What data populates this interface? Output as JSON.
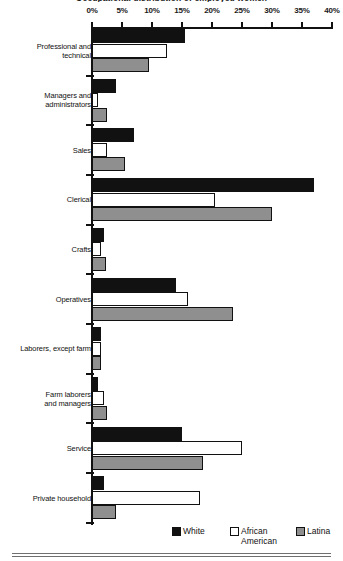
{
  "title": "Occupational distribution of employed women",
  "axis": {
    "tick_labels": [
      "0%",
      "5%",
      "10%",
      "15%",
      "20%",
      "25%",
      "30%",
      "35%",
      "40%"
    ],
    "min": 0,
    "max": 40
  },
  "legend": {
    "position": "bottom-right",
    "items": [
      {
        "label": "White",
        "key": "white",
        "color": "#111111"
      },
      {
        "label": "African\nAmerican",
        "key": "aa",
        "color": "#ffffff"
      },
      {
        "label": "Latina",
        "key": "latina",
        "color": "#8f8f8f"
      }
    ]
  },
  "chart_data": {
    "type": "bar",
    "orientation": "horizontal",
    "title": "Occupational distribution of employed women",
    "xlabel": "",
    "ylabel": "",
    "xlim": [
      0,
      40
    ],
    "xunit": "%",
    "grid": false,
    "legend_position": "bottom-right",
    "categories": [
      "Professional and technical",
      "Managers and administrators",
      "Sales",
      "Clerical",
      "Crafts",
      "Operatives",
      "Laborers, except farm",
      "Farm laborers and managers",
      "Service",
      "Private household"
    ],
    "series": [
      {
        "name": "White",
        "values": [
          15.5,
          4.0,
          7.0,
          37.0,
          2.0,
          14.0,
          1.5,
          1.0,
          15.0,
          2.0
        ]
      },
      {
        "name": "African American",
        "values": [
          12.5,
          1.0,
          2.5,
          20.5,
          1.5,
          16.0,
          1.5,
          2.0,
          25.0,
          18.0
        ]
      },
      {
        "name": "Latina",
        "values": [
          9.5,
          2.5,
          5.5,
          30.0,
          2.3,
          23.5,
          1.5,
          2.5,
          18.5,
          4.0
        ]
      }
    ]
  },
  "categories_display": [
    "Professional and\ntechnical",
    "Managers and\nadministrators",
    "Sales",
    "Clerical",
    "Crafts",
    "Operatives",
    "Laborers, except farm",
    "Farm laborers\nand managers",
    "Service",
    "Private household"
  ]
}
